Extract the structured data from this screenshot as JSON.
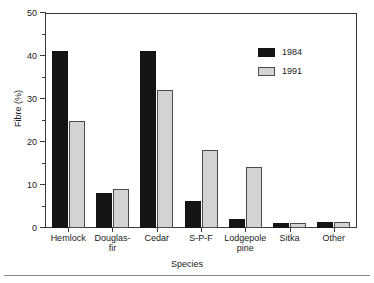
{
  "chart_data": {
    "type": "bar",
    "title": "",
    "xlabel": "Species",
    "ylabel": "Fibre (%)",
    "categories": [
      "Hemlock",
      "Douglas-\nfir",
      "Cedar",
      "S-P-F",
      "Lodgepole\npine",
      "Sitka",
      "Other"
    ],
    "series": [
      {
        "name": "1984",
        "color": "#141414",
        "values": [
          41.3,
          8.2,
          41.4,
          6.4,
          2.2,
          1.2,
          1.3
        ]
      },
      {
        "name": "1991",
        "color": "#d3d3d3",
        "values": [
          25.1,
          9.2,
          32.2,
          18.3,
          14.3,
          1.2,
          1.3
        ]
      }
    ],
    "ylim": [
      0,
      50
    ],
    "ymajor_ticks": [
      0,
      10,
      20,
      30,
      40,
      50
    ],
    "yminor_ticks": [
      5,
      15,
      25,
      35,
      45
    ],
    "ytick_labels": [
      "0",
      "10",
      "20",
      "30",
      "40",
      "50"
    ],
    "grid": false,
    "legend_position": "top-right",
    "legend_entries": [
      "1984",
      "1991"
    ]
  }
}
